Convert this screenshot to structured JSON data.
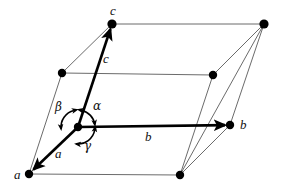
{
  "figure": {
    "type": "unit-cell-parallelepiped",
    "width": 281,
    "height": 193,
    "background_color": "#ffffff",
    "thick_line_color": "#000000",
    "thin_line_color": "#6b6b6b",
    "vertex_color": "#000000"
  },
  "vertices": [
    {
      "name": "origin",
      "x": 78,
      "y": 127,
      "radius": 4.2
    },
    {
      "name": "a",
      "x": 29,
      "y": 174,
      "radius": 4.2
    },
    {
      "name": "b",
      "x": 230,
      "y": 125,
      "radius": 4.2
    },
    {
      "name": "c",
      "x": 112,
      "y": 24,
      "radius": 4.6
    },
    {
      "name": "ab",
      "x": 180,
      "y": 175,
      "radius": 4.2
    },
    {
      "name": "ac",
      "x": 62,
      "y": 73,
      "radius": 4.2
    },
    {
      "name": "bc",
      "x": 264,
      "y": 24,
      "radius": 4.6
    },
    {
      "name": "abc",
      "x": 213,
      "y": 75,
      "radius": 4.2
    }
  ],
  "axis_vectors": [
    {
      "name": "a-vector",
      "x1": 78,
      "y1": 127,
      "x2": 29,
      "y2": 174,
      "width": 2.6
    },
    {
      "name": "b-vector",
      "x1": 78,
      "y1": 127,
      "x2": 230,
      "y2": 125,
      "width": 2.6
    },
    {
      "name": "c-vector",
      "x1": 78,
      "y1": 127,
      "x2": 112,
      "y2": 24,
      "width": 2.6
    }
  ],
  "thin_edges": [
    {
      "name": "edge-a-ab",
      "x1": 29,
      "y1": 174,
      "x2": 180,
      "y2": 175
    },
    {
      "name": "edge-b-ab",
      "x1": 230,
      "y1": 125,
      "x2": 180,
      "y2": 175
    },
    {
      "name": "edge-a-ac",
      "x1": 29,
      "y1": 174,
      "x2": 62,
      "y2": 73
    },
    {
      "name": "edge-c-ac",
      "x1": 112,
      "y1": 24,
      "x2": 62,
      "y2": 73
    },
    {
      "name": "edge-ac-abc",
      "x1": 62,
      "y1": 73,
      "x2": 213,
      "y2": 75
    },
    {
      "name": "edge-c-bc",
      "x1": 112,
      "y1": 24,
      "x2": 264,
      "y2": 24
    },
    {
      "name": "edge-b-bc",
      "x1": 230,
      "y1": 125,
      "x2": 264,
      "y2": 24
    },
    {
      "name": "edge-abc-bc",
      "x1": 213,
      "y1": 75,
      "x2": 264,
      "y2": 24
    },
    {
      "name": "edge-ab-abc",
      "x1": 180,
      "y1": 175,
      "x2": 213,
      "y2": 75
    },
    {
      "name": "edge-ab-bc",
      "x1": 180,
      "y1": 175,
      "x2": 264,
      "y2": 24
    }
  ],
  "angle_marker": {
    "name": "angle-arc-circle",
    "center_x": 78,
    "center_y": 127,
    "radius": 17,
    "stroke_width": 1.6,
    "arcs": [
      {
        "name": "alpha-arc",
        "start_deg": -78,
        "end_deg": -8
      },
      {
        "name": "beta-arc",
        "start_deg": 104,
        "end_deg": 186
      },
      {
        "name": "gamma-arc",
        "start_deg": 10,
        "end_deg": 96
      }
    ]
  },
  "labels": {
    "vertex_c": {
      "text": "c",
      "x": 110,
      "y": 4
    },
    "vertex_b": {
      "text": "b",
      "x": 240,
      "y": 118
    },
    "vertex_a": {
      "text": "a",
      "x": 14,
      "y": 168
    },
    "vector_c": {
      "text": "c",
      "x": 103,
      "y": 52
    },
    "vector_b": {
      "text": "b",
      "x": 145,
      "y": 130
    },
    "vector_a": {
      "text": "a",
      "x": 55,
      "y": 147
    },
    "angle_alpha": {
      "text": "α",
      "x": 93,
      "y": 100
    },
    "angle_beta": {
      "text": "β",
      "x": 55,
      "y": 101
    },
    "angle_gamma": {
      "text": "γ",
      "x": 84,
      "y": 140
    }
  }
}
